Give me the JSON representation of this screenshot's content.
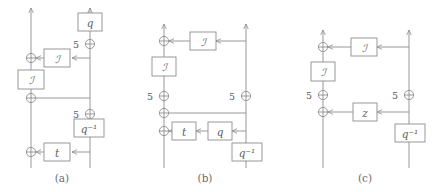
{
  "figure": {
    "type": "signal-flow-diagram-set",
    "panel_count": 3,
    "stroke_color": "#8d8d8d",
    "text_color": "#5c5c5c",
    "background": "#ffffff",
    "delay_label": "5",
    "captions": [
      "(a)",
      "(b)",
      "(c)"
    ]
  },
  "panels": [
    {
      "id": "a",
      "caption": "(a)",
      "blocks": [
        {
          "name": "block-q",
          "label": "q"
        },
        {
          "name": "block-I-upper-right",
          "label": "ℐ"
        },
        {
          "name": "block-I-left",
          "label": "ℐ"
        },
        {
          "name": "block-q-inverse",
          "label": "q⁻¹"
        },
        {
          "name": "block-t",
          "label": "t"
        }
      ],
      "delays": [
        {
          "name": "delay-upper",
          "label": "5"
        },
        {
          "name": "delay-lower",
          "label": "5"
        }
      ],
      "adders": [
        {
          "name": "adder-a1"
        },
        {
          "name": "adder-a2"
        },
        {
          "name": "adder-a3"
        }
      ]
    },
    {
      "id": "b",
      "caption": "(b)",
      "blocks": [
        {
          "name": "block-I-top",
          "label": "ℐ"
        },
        {
          "name": "block-I-left",
          "label": "ℐ"
        },
        {
          "name": "block-t",
          "label": "t"
        },
        {
          "name": "block-q",
          "label": "q"
        },
        {
          "name": "block-q-inverse",
          "label": "q⁻¹"
        }
      ],
      "delays": [
        {
          "name": "delay-left",
          "label": "5"
        },
        {
          "name": "delay-right",
          "label": "5"
        }
      ],
      "adders": [
        {
          "name": "adder-b1"
        },
        {
          "name": "adder-b2"
        },
        {
          "name": "adder-b3"
        },
        {
          "name": "adder-b4"
        }
      ]
    },
    {
      "id": "c",
      "caption": "(c)",
      "blocks": [
        {
          "name": "block-I-top",
          "label": "ℐ"
        },
        {
          "name": "block-I-left",
          "label": "ℐ"
        },
        {
          "name": "block-z",
          "label": "z"
        },
        {
          "name": "block-q-inverse",
          "label": "q⁻¹"
        }
      ],
      "delays": [
        {
          "name": "delay-left",
          "label": "5"
        },
        {
          "name": "delay-right",
          "label": "5"
        }
      ],
      "adders": [
        {
          "name": "adder-c1"
        },
        {
          "name": "adder-c2"
        },
        {
          "name": "adder-c3"
        },
        {
          "name": "adder-c4"
        }
      ]
    }
  ]
}
